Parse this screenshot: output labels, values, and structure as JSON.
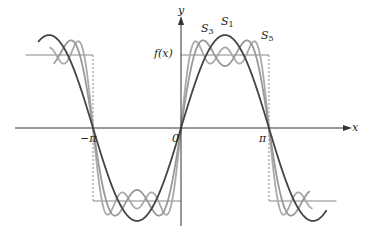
{
  "figure": {
    "axes": {
      "x_label": "x",
      "y_label": "y"
    },
    "ticks": {
      "neg_pi": "−π",
      "zero": "0",
      "pi": "π"
    },
    "labels": {
      "f": "f(x)",
      "s1": "S",
      "s1_sub": "1",
      "s3": "S",
      "s3_sub": "3",
      "s5": "S",
      "s5_sub": "5"
    },
    "colors": {
      "axis": "#333333",
      "s1": "#444444",
      "s3": "#999999",
      "s5": "#aaaaaa",
      "square": "#888888"
    }
  },
  "geometry": {
    "origin_x": 181,
    "origin_y": 128,
    "px_per_unit_x": 28.0,
    "amp_px": 73,
    "x_min": -5.6,
    "x_max": 5.6
  }
}
